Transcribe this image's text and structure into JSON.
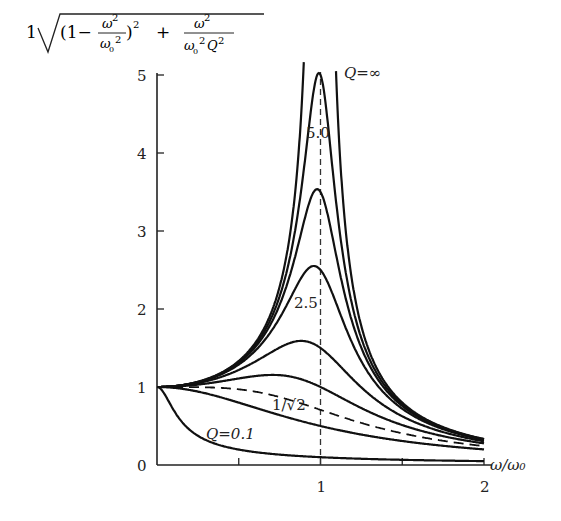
{
  "chart_data": {
    "type": "line",
    "xlabel": "ω/ω₀",
    "ylabel": "1/√((1−ω²/ω₀²)² + ω²/(ω₀²Q²))",
    "xlim": [
      0,
      2
    ],
    "ylim": [
      0,
      5
    ],
    "x_ticks": [
      0.5,
      1,
      1.5,
      2
    ],
    "x_tick_labels": [
      "",
      "1",
      "",
      "2"
    ],
    "y_ticks": [
      0,
      1,
      2,
      3,
      4,
      5
    ],
    "y_tick_labels": [
      "0",
      "1",
      "2",
      "3",
      "4",
      "5"
    ],
    "grid": false,
    "reference_line": {
      "x": 1,
      "style": "dashed"
    },
    "series": [
      {
        "name": "Q=0.1",
        "Q": 0.1,
        "style": "solid",
        "label": "Q=0.1"
      },
      {
        "name": "Q=0.5",
        "Q": 0.5,
        "style": "solid",
        "label": ""
      },
      {
        "name": "Q=1/√2",
        "Q": 0.7071,
        "style": "dashed",
        "label": "1/√2"
      },
      {
        "name": "Q=1",
        "Q": 1.0,
        "style": "solid",
        "label": ""
      },
      {
        "name": "Q=1.5",
        "Q": 1.5,
        "style": "solid",
        "label": ""
      },
      {
        "name": "Q=2.5",
        "Q": 2.5,
        "style": "solid",
        "label": "2.5"
      },
      {
        "name": "Q=3.5",
        "Q": 3.5,
        "style": "solid",
        "label": ""
      },
      {
        "name": "Q=5.0",
        "Q": 5.0,
        "style": "solid",
        "label": "5.0"
      },
      {
        "name": "Q=∞",
        "Q": "inf",
        "style": "solid",
        "label": "Q=∞"
      }
    ],
    "annotations": [
      {
        "text": "Q=∞",
        "x": 1.12,
        "y": 4.9
      },
      {
        "text": "5.0",
        "x": 1.0,
        "y": 4.1
      },
      {
        "text": "2.5",
        "x": 0.95,
        "y": 2.2
      },
      {
        "text": "1/√2",
        "x": 0.92,
        "y": 0.8
      },
      {
        "text": "Q=0.1",
        "x": 0.33,
        "y": 0.45
      }
    ]
  },
  "labels": {
    "title_one": "1",
    "x_axis": "ω/ω₀",
    "q_inf": "Q=∞",
    "q_5": "5.0",
    "q_2_5": "2.5",
    "q_inv_sqrt2": "1/√2",
    "q_0_1": "Q=0.1"
  }
}
